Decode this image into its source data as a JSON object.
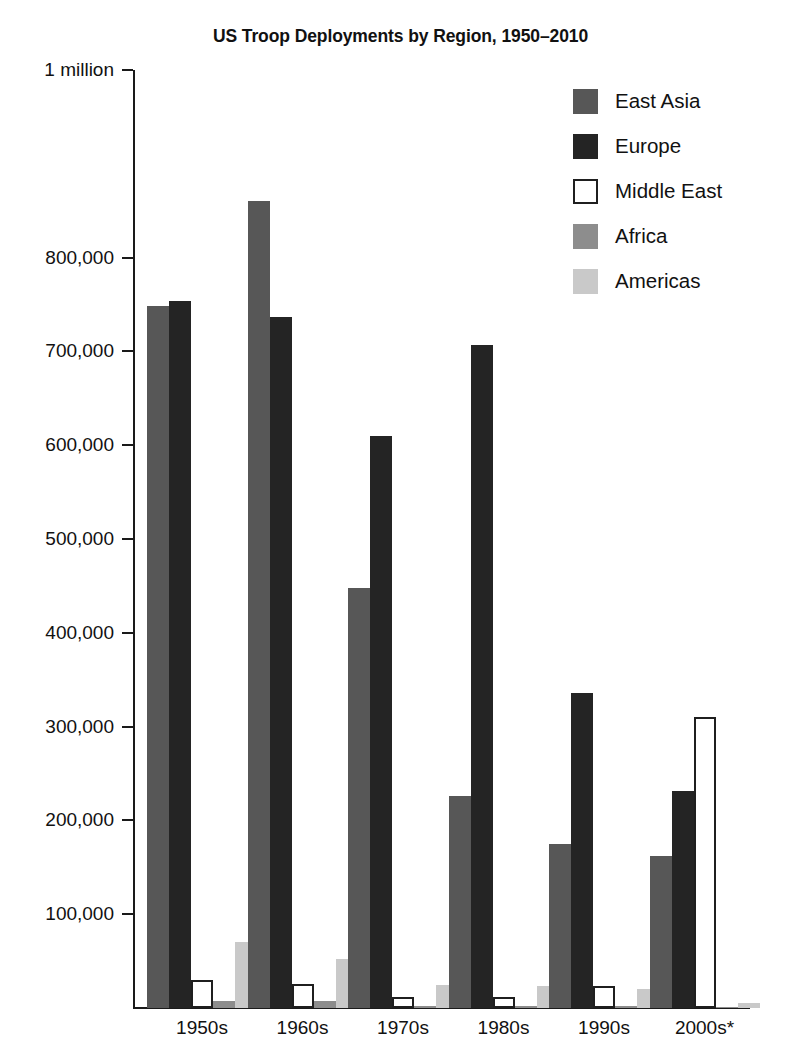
{
  "chart_data": {
    "type": "bar",
    "title": "US Troop Deployments by Region, 1950–2010",
    "xlabel": "",
    "ylabel": "",
    "ylim": [
      0,
      1000000
    ],
    "grid": false,
    "legend_position": "top-right",
    "categories": [
      "1950s",
      "1960s",
      "1970s",
      "1980s",
      "1990s",
      "2000s*"
    ],
    "ytick_values": [
      100000,
      200000,
      300000,
      400000,
      500000,
      600000,
      700000,
      800000,
      1000000
    ],
    "ytick_labels": [
      "100,000",
      "200,000",
      "300,000",
      "400,000",
      "500,000",
      "600,000",
      "700,000",
      "800,000",
      "1 million"
    ],
    "series": [
      {
        "name": "East Asia",
        "color": "#575757",
        "values": [
          748000,
          860000,
          448000,
          226000,
          175000,
          162000
        ]
      },
      {
        "name": "Europe",
        "color": "#242424",
        "values": [
          754000,
          737000,
          610000,
          707000,
          336000,
          231000
        ]
      },
      {
        "name": "Middle East",
        "color": "#ffffff",
        "values": [
          30000,
          26000,
          12000,
          12000,
          24000,
          310000
        ]
      },
      {
        "name": "Africa",
        "color": "#8d8d8d",
        "values": [
          8000,
          7000,
          2000,
          2000,
          2000,
          1000
        ]
      },
      {
        "name": "Americas",
        "color": "#c9c9c9",
        "values": [
          70000,
          52000,
          25000,
          24000,
          20000,
          5000
        ]
      }
    ]
  },
  "legend": {
    "items": [
      {
        "label": "East Asia",
        "swatch": "east-asia"
      },
      {
        "label": "Europe",
        "swatch": "europe"
      },
      {
        "label": "Middle East",
        "swatch": "middle-east"
      },
      {
        "label": "Africa",
        "swatch": "africa"
      },
      {
        "label": "Americas",
        "swatch": "americas"
      }
    ]
  }
}
